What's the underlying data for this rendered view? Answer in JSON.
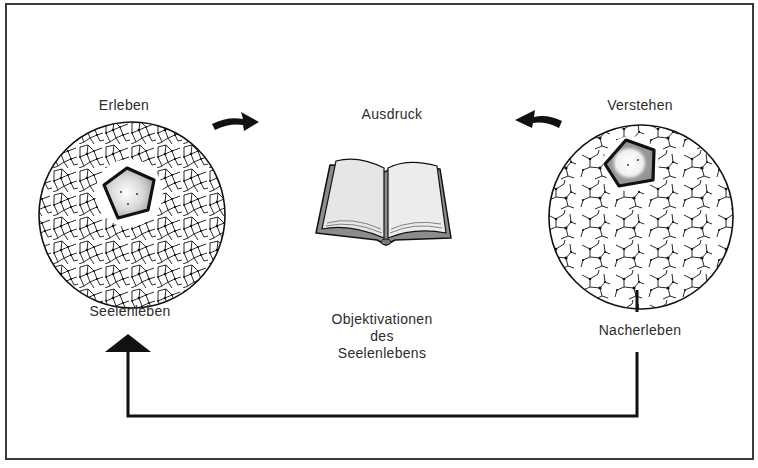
{
  "diagram": {
    "left_node": {
      "top_label": "Erleben",
      "bottom_label": "Seelenleben",
      "icon": "network-circle-with-pentagon"
    },
    "center_node": {
      "top_label": "Ausdruck",
      "bottom_label_lines": [
        "Objektivationen",
        "des",
        "Seelenlebens"
      ],
      "icon": "open-book"
    },
    "right_node": {
      "top_label": "Verstehen",
      "bottom_label": "Nacherleben",
      "icon": "network-circle-with-pentagon"
    },
    "edges": [
      {
        "from": "Erleben",
        "to": "Ausdruck",
        "style": "curved-arrow"
      },
      {
        "from": "Verstehen",
        "to": "Ausdruck",
        "style": "curved-arrow"
      },
      {
        "from": "Nacherleben",
        "to": "Seelenleben",
        "style": "elbow-line-with-arrowhead"
      }
    ],
    "colors": {
      "ink": "#111111",
      "text": "#2c2c2c",
      "pentagon_fill": "#9a9a9a",
      "book_cover": "#8c8c8c",
      "book_page": "#e6e6e6"
    }
  }
}
